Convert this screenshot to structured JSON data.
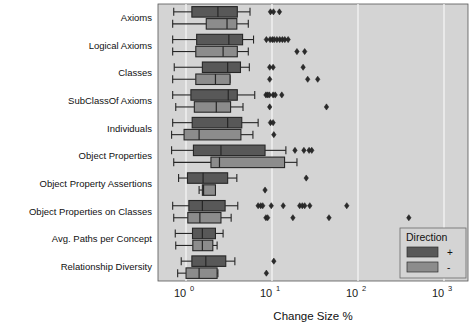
{
  "chart_data": {
    "type": "box",
    "title": "",
    "xlabel": "Change Size %",
    "ylabel": "",
    "xscale": "log",
    "xlim": [
      0.55,
      2200
    ],
    "grid": true,
    "grid_axis": "x",
    "xticks": [
      1,
      10,
      100,
      1000
    ],
    "xticklabels": [
      "10",
      "10",
      "10",
      "10"
    ],
    "xtick_exponents": [
      "0",
      "1",
      "2",
      "3"
    ],
    "categories": [
      "Axioms",
      "Logical Axioms",
      "Classes",
      "SubClassOf Axioms",
      "Individuals",
      "Object Properties",
      "Object Property Assertions",
      "Object Properties on Classes",
      "Avg. Paths per Concept",
      "Relationship Diversity"
    ],
    "legend": {
      "title": "Direction",
      "position": "lower-right",
      "entries": [
        {
          "label": "+",
          "color": "#585858"
        },
        {
          "label": "-",
          "color": "#8c8c8c"
        }
      ]
    },
    "series": [
      {
        "name": "+",
        "color": "#585858",
        "boxes": [
          {
            "category": "Axioms",
            "whisker_low": 0.72,
            "q1": 1.17,
            "median": 2.35,
            "q3": 3.95,
            "whisker_high": 5.55,
            "outliers": [
              9.6,
              10.4,
              12.2
            ]
          },
          {
            "category": "Logical Axioms",
            "whisker_low": 0.7,
            "q1": 1.33,
            "median": 3.15,
            "q3": 4.55,
            "whisker_high": 6.1,
            "outliers": [
              8.6,
              9.5,
              10.1,
              10.6,
              11.4,
              12.3,
              13.2,
              14.1,
              15.4
            ]
          },
          {
            "category": "Classes",
            "whisker_low": 0.73,
            "q1": 1.55,
            "median": 3.05,
            "q3": 4.3,
            "whisker_high": 5.45,
            "outliers": [
              9.4,
              10.3,
              23.0
            ]
          },
          {
            "category": "SubClassOf Axioms",
            "whisker_low": 0.7,
            "q1": 1.14,
            "median": 3.1,
            "q3": 3.95,
            "whisker_high": 6.3,
            "outliers": [
              8.5,
              8.9,
              9.3,
              10.3,
              10.9,
              13.0
            ]
          },
          {
            "category": "Individuals",
            "whisker_low": 0.7,
            "q1": 1.18,
            "median": 3.05,
            "q3": 4.45,
            "whisker_high": 6.9,
            "outliers": [
              9.6,
              10.3
            ]
          },
          {
            "category": "Object Properties",
            "whisker_low": 0.68,
            "q1": 1.22,
            "median": 2.55,
            "q3": 8.3,
            "whisker_high": 14.5,
            "outliers": [
              18.5,
              23.5,
              27.0,
              29.0
            ]
          },
          {
            "category": "Object Property Assertions",
            "whisker_low": 0.82,
            "q1": 1.04,
            "median": 1.58,
            "q3": 3.05,
            "whisker_high": 3.9,
            "outliers": [
              25.0
            ]
          },
          {
            "category": "Object Properties on Classes",
            "whisker_low": 0.7,
            "q1": 1.08,
            "median": 1.55,
            "q3": 2.85,
            "whisker_high": 4.0,
            "outliers": [
              6.9,
              7.4,
              7.8,
              9.8,
              13.5,
              21.0,
              22.5,
              24.0,
              27.5,
              74.0
            ]
          },
          {
            "category": "Avg. Paths per Concept",
            "whisker_low": 0.75,
            "q1": 1.19,
            "median": 1.55,
            "q3": 2.2,
            "whisker_high": 2.7,
            "outliers": []
          },
          {
            "category": "Relationship Diversity",
            "whisker_low": 0.88,
            "q1": 1.17,
            "median": 1.7,
            "q3": 2.9,
            "whisker_high": 3.7,
            "outliers": [
              10.5
            ]
          }
        ]
      },
      {
        "name": "-",
        "color": "#8c8c8c",
        "boxes": [
          {
            "category": "Axioms",
            "whisker_low": 0.7,
            "q1": 1.72,
            "median": 3.0,
            "q3": 3.9,
            "whisker_high": 5.3,
            "outliers": []
          },
          {
            "category": "Logical Axioms",
            "whisker_low": 0.7,
            "q1": 1.3,
            "median": 2.7,
            "q3": 3.95,
            "whisker_high": 5.3,
            "outliers": [
              19.5,
              24.0
            ]
          },
          {
            "category": "Classes",
            "whisker_low": 0.7,
            "q1": 1.3,
            "median": 2.2,
            "q3": 3.25,
            "whisker_high": 3.25,
            "outliers": [
              9.4,
              26.0,
              34.0
            ]
          },
          {
            "category": "SubClassOf Axioms",
            "whisker_low": 0.76,
            "q1": 1.25,
            "median": 2.25,
            "q3": 3.3,
            "whisker_high": 4.6,
            "outliers": [
              9.4,
              43.0
            ]
          },
          {
            "category": "Individuals",
            "whisker_low": 0.68,
            "q1": 0.95,
            "median": 1.42,
            "q3": 4.35,
            "whisker_high": 6.0,
            "outliers": [
              10.5
            ]
          },
          {
            "category": "Object Properties",
            "whisker_low": 0.72,
            "q1": 1.95,
            "median": 2.45,
            "q3": 14.0,
            "whisker_high": 19.5,
            "outliers": []
          },
          {
            "category": "Object Property Assertions",
            "whisker_low": 1.42,
            "q1": 1.55,
            "median": 1.6,
            "q3": 2.2,
            "whisker_high": 2.2,
            "outliers": [
              8.3
            ]
          },
          {
            "category": "Object Properties on Classes",
            "whisker_low": 0.72,
            "q1": 1.05,
            "median": 1.45,
            "q3": 2.55,
            "whisker_high": 3.35,
            "outliers": [
              8.5,
              8.9,
              17.5,
              46.0,
              390.0
            ]
          },
          {
            "category": "Avg. Paths per Concept",
            "whisker_low": 0.76,
            "q1": 1.2,
            "median": 1.55,
            "q3": 2.05,
            "whisker_high": 2.3,
            "outliers": []
          },
          {
            "category": "Relationship Diversity",
            "whisker_low": 0.8,
            "q1": 1.0,
            "median": 1.42,
            "q3": 2.3,
            "whisker_high": 2.35,
            "outliers": [
              8.6
            ]
          }
        ]
      }
    ]
  },
  "style": {
    "panel_bg": "#d4d4d4",
    "page_bg": "#ffffff",
    "grid_color": "#f2f2f2",
    "line_color": "#262626",
    "plus_color": "#585858",
    "minus_color": "#8c8c8c"
  }
}
